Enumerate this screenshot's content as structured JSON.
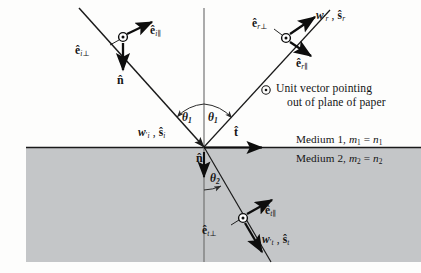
{
  "figure": {
    "interface_y": 147,
    "origin": {
      "x": 204,
      "y": 147
    }
  },
  "colors": {
    "background": "#fdfdfc",
    "medium2_fill": "#c4c6c8",
    "ray_stroke": "#1a1a1a",
    "vector_stroke": "#0d0d0d",
    "normal_line": "#6a6a6a",
    "text": "#141414"
  },
  "labels": {
    "incident_perp": "ê_i⊥",
    "incident_par": "ê_i∥",
    "incident_wave": "w′_i , ŝ_i",
    "normal_down": "n̂",
    "tangent": "t̂",
    "reflected_perp": "ê_r⊥",
    "reflected_par": "ê_r∥",
    "reflected_wave": "w′_r , ŝ_r",
    "transmitted_perp": "ê_t⊥",
    "transmitted_par": "ê_t∥",
    "transmitted_wave": "w′_t , ŝ_t",
    "theta1_left": "θ1",
    "theta1_right": "θ1",
    "theta2": "θ2"
  },
  "legend": {
    "symbol": "⊙",
    "line1": "Unit vector pointing",
    "line2": "out of plane of paper"
  },
  "media": {
    "medium1": "Medium 1, m₁ = n₁",
    "medium2": "Medium 2, m₂ = n₂"
  },
  "angles": {
    "theta1_deg": 38,
    "theta2_deg": 23
  }
}
